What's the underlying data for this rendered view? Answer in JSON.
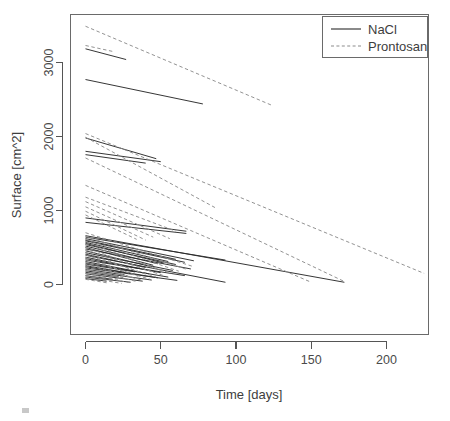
{
  "figure": {
    "width": 450,
    "height": 421,
    "background": "#ffffff"
  },
  "colors": {
    "nacl": "#2b2b2b",
    "prontosan": "#8c8c8c",
    "axis": "#555555",
    "frame": "#6a6a6a",
    "text": "#3d3d3d"
  },
  "chart_data": {
    "type": "line",
    "title": "",
    "xlabel": "Time [days]",
    "ylabel": "Surface [cm^2]",
    "xlim": [
      -12,
      238
    ],
    "ylim": [
      -700,
      3650
    ],
    "xticks": [
      0,
      50,
      100,
      150,
      200
    ],
    "yticks": [
      0,
      1000,
      2000,
      3000
    ],
    "xtick_labels": [
      "0",
      "50",
      "100",
      "150",
      "200"
    ],
    "ytick_labels": [
      "0",
      "1000",
      "2000",
      "3000"
    ],
    "grid": false,
    "legend_position": "top-right",
    "legend": [
      {
        "name": "NaCl",
        "style": "solid",
        "color": "#2b2b2b"
      },
      {
        "name": "Prontosan",
        "style": "dashed",
        "color": "#8c8c8c"
      }
    ],
    "series": [
      {
        "name": "NaCl",
        "style": "solid",
        "color": "#2b2b2b",
        "lines": [
          {
            "x": [
              0,
              27
            ],
            "y": [
              3185,
              3040
            ]
          },
          {
            "x": [
              0,
              78
            ],
            "y": [
              2770,
              2440
            ]
          },
          {
            "x": [
              0,
              47
            ],
            "y": [
              1980,
              1700
            ]
          },
          {
            "x": [
              0,
              50
            ],
            "y": [
              1800,
              1660
            ]
          },
          {
            "x": [
              0,
              40
            ],
            "y": [
              1755,
              1640
            ]
          },
          {
            "x": [
              0,
              67
            ],
            "y": [
              900,
              720
            ]
          },
          {
            "x": [
              0,
              67
            ],
            "y": [
              840,
              690
            ]
          },
          {
            "x": [
              0,
              172
            ],
            "y": [
              660,
              30
            ]
          },
          {
            "x": [
              0,
              93
            ],
            "y": [
              640,
              330
            ]
          },
          {
            "x": [
              0,
              72
            ],
            "y": [
              620,
              320
            ]
          },
          {
            "x": [
              0,
              60
            ],
            "y": [
              600,
              340
            ]
          },
          {
            "x": [
              0,
              66
            ],
            "y": [
              590,
              300
            ]
          },
          {
            "x": [
              0,
              55
            ],
            "y": [
              570,
              310
            ]
          },
          {
            "x": [
              0,
              52
            ],
            "y": [
              555,
              290
            ]
          },
          {
            "x": [
              0,
              60
            ],
            "y": [
              540,
              270
            ]
          },
          {
            "x": [
              0,
              48
            ],
            "y": [
              520,
              280
            ]
          },
          {
            "x": [
              0,
              45
            ],
            "y": [
              500,
              260
            ]
          },
          {
            "x": [
              0,
              70
            ],
            "y": [
              480,
              210
            ]
          },
          {
            "x": [
              0,
              44
            ],
            "y": [
              455,
              240
            ]
          },
          {
            "x": [
              0,
              58
            ],
            "y": [
              430,
              190
            ]
          },
          {
            "x": [
              0,
              40
            ],
            "y": [
              410,
              230
            ]
          },
          {
            "x": [
              0,
              93
            ],
            "y": [
              395,
              30
            ]
          },
          {
            "x": [
              0,
              36
            ],
            "y": [
              370,
              215
            ]
          },
          {
            "x": [
              0,
              50
            ],
            "y": [
              350,
              160
            ]
          },
          {
            "x": [
              0,
              66
            ],
            "y": [
              330,
              120
            ]
          },
          {
            "x": [
              0,
              42
            ],
            "y": [
              310,
              145
            ]
          },
          {
            "x": [
              0,
              55
            ],
            "y": [
              290,
              100
            ]
          },
          {
            "x": [
              0,
              33
            ],
            "y": [
              275,
              170
            ]
          },
          {
            "x": [
              0,
              48
            ],
            "y": [
              255,
              90
            ]
          },
          {
            "x": [
              0,
              30
            ],
            "y": [
              240,
              150
            ]
          },
          {
            "x": [
              0,
              61
            ],
            "y": [
              225,
              55
            ]
          },
          {
            "x": [
              0,
              26
            ],
            "y": [
              205,
              130
            ]
          },
          {
            "x": [
              0,
              44
            ],
            "y": [
              185,
              60
            ]
          },
          {
            "x": [
              0,
              22
            ],
            "y": [
              165,
              105
            ]
          },
          {
            "x": [
              0,
              38
            ],
            "y": [
              145,
              45
            ]
          },
          {
            "x": [
              0,
              18
            ],
            "y": [
              120,
              70
            ]
          },
          {
            "x": [
              0,
              30
            ],
            "y": [
              100,
              30
            ]
          },
          {
            "x": [
              0,
              14
            ],
            "y": [
              80,
              45
            ]
          }
        ]
      },
      {
        "name": "Prontosan",
        "style": "dashed",
        "color": "#8c8c8c",
        "lines": [
          {
            "x": [
              0,
              124
            ],
            "y": [
              3490,
              2420
            ]
          },
          {
            "x": [
              0,
              18
            ],
            "y": [
              3230,
              3150
            ]
          },
          {
            "x": [
              0,
              225
            ],
            "y": [
              2040,
              150
            ]
          },
          {
            "x": [
              0,
              86
            ],
            "y": [
              1990,
              1040
            ]
          },
          {
            "x": [
              0,
              172
            ],
            "y": [
              1710,
              40
            ]
          },
          {
            "x": [
              0,
              150
            ],
            "y": [
              1340,
              30
            ]
          },
          {
            "x": [
              0,
              60
            ],
            "y": [
              1180,
              720
            ]
          },
          {
            "x": [
              0,
              56
            ],
            "y": [
              1120,
              620
            ]
          },
          {
            "x": [
              0,
              45
            ],
            "y": [
              1050,
              640
            ]
          },
          {
            "x": [
              0,
              40
            ],
            "y": [
              990,
              600
            ]
          },
          {
            "x": [
              0,
              34
            ],
            "y": [
              940,
              610
            ]
          },
          {
            "x": [
              0,
              72
            ],
            "y": [
              700,
              240
            ]
          },
          {
            "x": [
              0,
              68
            ],
            "y": [
              650,
              200
            ]
          },
          {
            "x": [
              0,
              62
            ],
            "y": [
              610,
              180
            ]
          },
          {
            "x": [
              0,
              50
            ],
            "y": [
              580,
              190
            ]
          },
          {
            "x": [
              0,
              57
            ],
            "y": [
              545,
              150
            ]
          },
          {
            "x": [
              0,
              46
            ],
            "y": [
              505,
              160
            ]
          },
          {
            "x": [
              0,
              52
            ],
            "y": [
              470,
              120
            ]
          },
          {
            "x": [
              0,
              40
            ],
            "y": [
              430,
              140
            ]
          },
          {
            "x": [
              0,
              47
            ],
            "y": [
              400,
              100
            ]
          },
          {
            "x": [
              0,
              35
            ],
            "y": [
              365,
              110
            ]
          },
          {
            "x": [
              0,
              43
            ],
            "y": [
              335,
              70
            ]
          },
          {
            "x": [
              0,
              31
            ],
            "y": [
              300,
              95
            ]
          },
          {
            "x": [
              0,
              38
            ],
            "y": [
              270,
              55
            ]
          },
          {
            "x": [
              0,
              27
            ],
            "y": [
              240,
              80
            ]
          },
          {
            "x": [
              0,
              34
            ],
            "y": [
              210,
              40
            ]
          },
          {
            "x": [
              0,
              23
            ],
            "y": [
              180,
              65
            ]
          },
          {
            "x": [
              0,
              29
            ],
            "y": [
              150,
              25
            ]
          },
          {
            "x": [
              0,
              19
            ],
            "y": [
              120,
              50
            ]
          },
          {
            "x": [
              0,
              24
            ],
            "y": [
              95,
              15
            ]
          },
          {
            "x": [
              0,
              15
            ],
            "y": [
              70,
              20
            ]
          }
        ]
      }
    ]
  }
}
